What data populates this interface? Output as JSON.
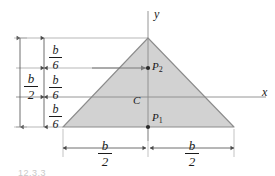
{
  "figure": {
    "type": "engineering-mechanics-diagram",
    "background_color": "#ffffff",
    "shape_fill_color": "#d2d2d2",
    "shape_stroke_color": "#808080",
    "line_color": "#808080",
    "text_color": "#1a1a1a",
    "caption": "12.3.3"
  },
  "axes": {
    "y_axis_label": "y",
    "x_axis_label": "x"
  },
  "points": [
    {
      "id": "P2",
      "base": "P",
      "sub": "2"
    },
    {
      "id": "P1",
      "base": "P",
      "sub": "1"
    }
  ],
  "centroid": {
    "label": "C"
  },
  "dimensions": {
    "vertical_total": {
      "numerator": "b",
      "denominator": "2"
    },
    "vertical_segments": [
      {
        "numerator": "b",
        "denominator": "6"
      },
      {
        "numerator": "b",
        "denominator": "6"
      },
      {
        "numerator": "b",
        "denominator": "6"
      }
    ],
    "horizontal_left": {
      "numerator": "b",
      "denominator": "2"
    },
    "horizontal_right": {
      "numerator": "b",
      "denominator": "2"
    }
  },
  "geometry": {
    "apex_x": 148,
    "apex_y": 38,
    "left_x": 63,
    "left_y": 127,
    "right_x": 234,
    "right_y": 127,
    "p2_y": 68,
    "xaxis_y": 97,
    "p1_y": 127
  }
}
